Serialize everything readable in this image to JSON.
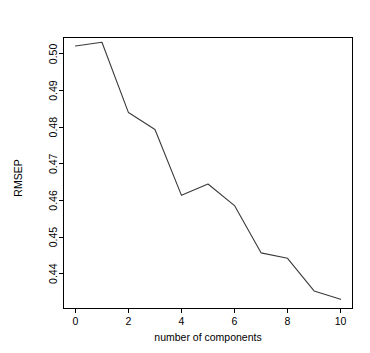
{
  "chart_data": {
    "type": "line",
    "title": "Cross-validation plot",
    "xlabel": "number of components",
    "ylabel": "RMSEP",
    "x": [
      0,
      1,
      2,
      3,
      4,
      5,
      6,
      7,
      8,
      9,
      10
    ],
    "values": [
      0.5022,
      0.5032,
      0.484,
      0.4794,
      0.4614,
      0.4645,
      0.4586,
      0.4457,
      0.4442,
      0.4353,
      0.433
    ],
    "series": [
      {
        "name": "RMSEP",
        "values": [
          0.5022,
          0.5032,
          0.484,
          0.4794,
          0.4614,
          0.4645,
          0.4586,
          0.4457,
          0.4442,
          0.4353,
          0.433
        ]
      }
    ],
    "xlim": [
      -0.45,
      10.45
    ],
    "ylim": [
      0.4305,
      0.5045
    ],
    "xticks": [
      0,
      2,
      4,
      6,
      8,
      10
    ],
    "xtick_labels": [
      "0",
      "2",
      "4",
      "6",
      "8",
      "10"
    ],
    "yticks": [
      0.44,
      0.45,
      0.46,
      0.47,
      0.48,
      0.49,
      0.5
    ],
    "ytick_labels": [
      "0.44",
      "0.45",
      "0.46",
      "0.47",
      "0.48",
      "0.49",
      "0.50"
    ],
    "grid": false,
    "legend": false,
    "line_color": "#3a3a3a",
    "axis_color": "#000000",
    "background": "#ffffff"
  }
}
